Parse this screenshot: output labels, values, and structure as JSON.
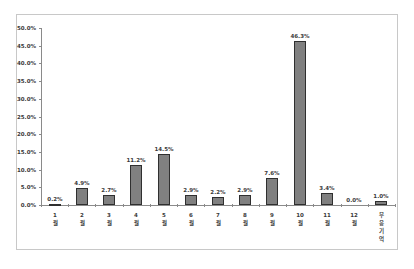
{
  "chart_data": {
    "type": "bar",
    "title": "",
    "xlabel": "",
    "ylabel": "",
    "categories": [
      [
        "1",
        "월"
      ],
      [
        "2",
        "월"
      ],
      [
        "3",
        "월"
      ],
      [
        "4",
        "월"
      ],
      [
        "5",
        "월"
      ],
      [
        "6",
        "월"
      ],
      [
        "7",
        "월"
      ],
      [
        "8",
        "월"
      ],
      [
        "9",
        "월"
      ],
      [
        "10",
        "월"
      ],
      [
        "11",
        "월"
      ],
      [
        "12",
        "월"
      ],
      [
        "무",
        "응",
        "기",
        "억"
      ]
    ],
    "values": [
      0.2,
      4.9,
      2.7,
      11.2,
      14.5,
      2.9,
      2.2,
      2.9,
      7.6,
      46.3,
      3.4,
      0.0,
      1.0
    ],
    "value_labels": [
      "0.2%",
      "4.9%",
      "2.7%",
      "11.2%",
      "14.5%",
      "2.9%",
      "2.2%",
      "2.9%",
      "7.6%",
      "46.3%",
      "3.4%",
      "0.0%",
      "1.0%"
    ],
    "ylim": [
      0,
      50
    ],
    "y_ticks": [
      "0.0%",
      "5.0%",
      "10.0%",
      "15.0%",
      "20.0%",
      "25.0%",
      "30.0%",
      "35.0%",
      "40.0%",
      "45.0%",
      "50.0%"
    ],
    "grid": false,
    "legend": null,
    "colors": {
      "bar_fill": "#808080",
      "bar_outline": "#2f2f2f",
      "axis": "#8a8a8a",
      "frame": "#c8c8c8"
    }
  }
}
